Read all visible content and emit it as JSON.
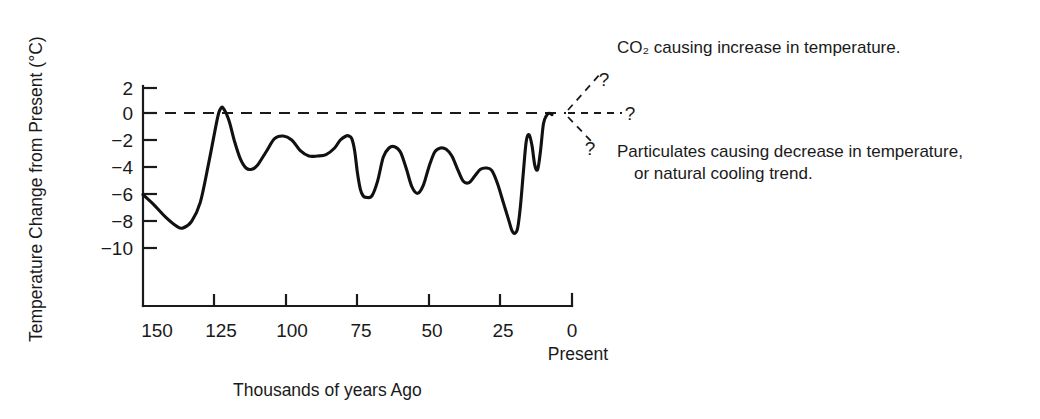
{
  "chart_data": {
    "type": "line",
    "title": "",
    "xlabel": "Thousands of years Ago",
    "ylabel": "Temperature Change from Present (°C)",
    "x_axis_note": "Present",
    "xlim": [
      150,
      0
    ],
    "ylim": [
      -11,
      2
    ],
    "xticks": [
      150,
      125,
      100,
      75,
      50,
      25,
      0
    ],
    "xtick_labels": [
      "150",
      "125",
      "100",
      "75",
      "50",
      "25",
      "0"
    ],
    "yticks": [
      2,
      0,
      -2,
      -4,
      -6,
      -8,
      -10
    ],
    "ytick_labels": [
      "2",
      "0",
      "−2",
      "−4",
      "−6",
      "−8",
      "−10"
    ],
    "grid": false,
    "legend": "none",
    "zero_reference_line": {
      "value": 0,
      "style": "dashed",
      "label": "present-day temperature"
    },
    "series": [
      {
        "name": "Temperature change from present",
        "x": [
          150,
          146,
          142,
          138,
          136,
          133,
          130,
          127,
          124,
          123,
          122,
          120,
          118,
          116,
          114,
          112,
          110,
          107,
          104,
          101,
          98,
          95,
          92,
          89,
          86,
          83,
          81,
          79,
          78,
          77,
          76,
          75,
          74,
          73,
          72,
          70,
          68,
          66,
          64,
          62,
          60,
          58,
          56,
          54,
          52,
          50,
          48,
          46,
          44,
          42,
          40,
          38,
          36,
          34,
          32,
          30,
          28,
          26,
          24,
          22,
          21,
          20,
          19,
          18,
          17,
          16,
          15,
          14,
          13,
          12,
          11,
          10,
          9,
          8,
          7
        ],
        "y": [
          -6.0,
          -6.8,
          -7.7,
          -8.4,
          -8.5,
          -8.0,
          -6.6,
          -3.6,
          -0.3,
          0.4,
          0.5,
          -0.4,
          -2.0,
          -3.3,
          -4.0,
          -4.1,
          -3.8,
          -2.8,
          -1.8,
          -1.6,
          -1.9,
          -2.7,
          -3.1,
          -3.1,
          -3.0,
          -2.5,
          -1.9,
          -1.6,
          -1.6,
          -1.8,
          -2.7,
          -4.4,
          -5.6,
          -6.1,
          -6.2,
          -6.1,
          -5.0,
          -3.2,
          -2.5,
          -2.4,
          -2.8,
          -4.0,
          -5.4,
          -5.9,
          -5.3,
          -3.9,
          -2.8,
          -2.5,
          -2.6,
          -3.1,
          -4.1,
          -5.0,
          -5.1,
          -4.6,
          -4.1,
          -4.0,
          -4.2,
          -5.2,
          -6.6,
          -8.0,
          -8.7,
          -8.9,
          -8.5,
          -6.8,
          -4.3,
          -2.0,
          -1.5,
          -2.3,
          -3.8,
          -4.1,
          -2.7,
          -0.7,
          -0.1,
          0.1,
          0.0
        ]
      }
    ],
    "annotations": [
      {
        "id": "co2-annotation",
        "text": "CO₂ causing increase in temperature.",
        "marker": "?",
        "branch": "up"
      },
      {
        "id": "neutral-annotation",
        "text": "",
        "marker": "?",
        "branch": "flat"
      },
      {
        "id": "particulates-annotation",
        "text": "Particulates causing decrease in temperature,",
        "text_line2": "or natural cooling trend.",
        "marker": "?",
        "branch": "down"
      }
    ]
  },
  "labels": {
    "ylabel": "Temperature Change from Present (°C)",
    "xlabel": "Thousands of years Ago",
    "present": "Present",
    "q_up": "?",
    "q_flat": "?",
    "q_down": "?",
    "annot_co2": "CO₂ causing increase in temperature.",
    "annot_particulates_line1": "Particulates causing decrease in temperature,",
    "annot_particulates_line2": "or natural cooling trend.",
    "ytick_0": "2",
    "ytick_1": "0",
    "ytick_2": "−2",
    "ytick_3": "−4",
    "ytick_4": "−6",
    "ytick_5": "−8",
    "ytick_6": "−10",
    "xtick_0": "150",
    "xtick_1": "125",
    "xtick_2": "100",
    "xtick_3": "75",
    "xtick_4": "50",
    "xtick_5": "25",
    "xtick_6": "0"
  },
  "colors": {
    "ink": "#1a1a1a",
    "curve": "#111111",
    "background": "#ffffff"
  }
}
